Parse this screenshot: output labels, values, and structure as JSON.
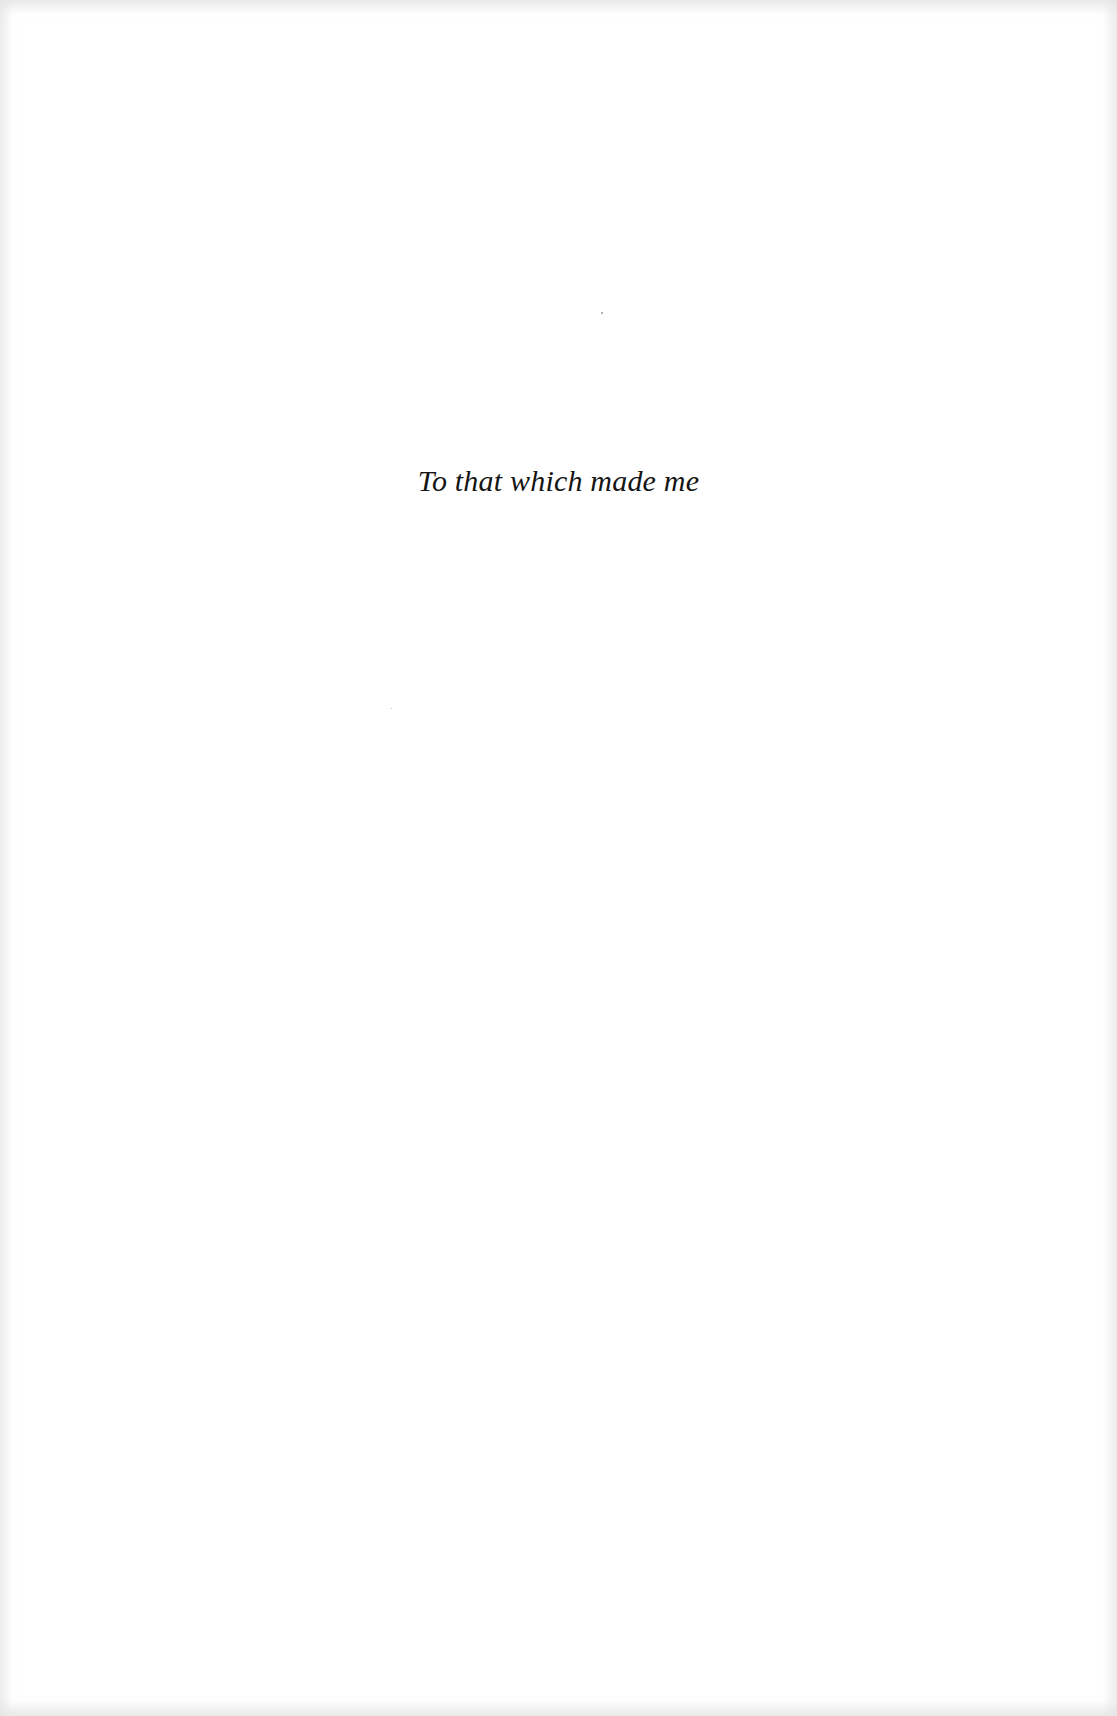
{
  "page": {
    "type": "dedication",
    "dedication_text": "To that which made me"
  }
}
